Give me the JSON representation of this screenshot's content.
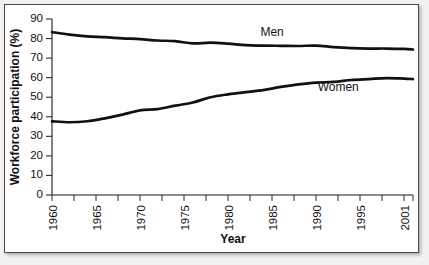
{
  "chart_data": {
    "type": "line",
    "title": "",
    "subtitle": "",
    "xlabel": "Year",
    "ylabel": "Workforce participation (%)",
    "xlim": [
      1960,
      2001
    ],
    "ylim": [
      0,
      90
    ],
    "yticks": [
      0,
      10,
      20,
      30,
      40,
      50,
      60,
      70,
      80,
      90
    ],
    "ytick_labels": [
      "0",
      "10",
      "20",
      "30",
      "40",
      "50",
      "60",
      "70",
      "80",
      "90"
    ],
    "xticks": [
      1960,
      1965,
      1970,
      1975,
      1980,
      1985,
      1990,
      1995,
      2001
    ],
    "xtick_labels": [
      "1960",
      "1965",
      "1970",
      "1975",
      "1980",
      "1985",
      "1990",
      "1995",
      "2001"
    ],
    "x_minor_tick_interval": 2.5,
    "grid": false,
    "legend_position": "inline-annotation",
    "line_color": "#111111",
    "frame_color": "#4b4b4b",
    "background_color": "#ffffff",
    "x": [
      1960,
      1962,
      1964,
      1966,
      1968,
      1970,
      1972,
      1974,
      1976,
      1978,
      1980,
      1982,
      1984,
      1986,
      1988,
      1990,
      1992,
      1994,
      1996,
      1998,
      2000,
      2001
    ],
    "series": [
      {
        "name": "Men",
        "label": "Men",
        "values": [
          83.3,
          82.0,
          81.1,
          80.7,
          80.1,
          79.7,
          79.0,
          78.7,
          77.5,
          77.9,
          77.4,
          76.6,
          76.4,
          76.3,
          76.2,
          76.4,
          75.6,
          75.1,
          74.9,
          74.9,
          74.7,
          74.4
        ]
      },
      {
        "name": "Women",
        "label": "Women",
        "values": [
          37.7,
          37.2,
          37.7,
          39.2,
          41.1,
          43.3,
          43.9,
          45.7,
          47.3,
          50.0,
          51.5,
          52.6,
          53.6,
          55.3,
          56.6,
          57.5,
          57.8,
          58.8,
          59.3,
          59.8,
          59.5,
          59.3
        ]
      }
    ],
    "annotations": [
      {
        "text": "Men",
        "x": 1985.0,
        "y": 81.5
      },
      {
        "text": "Women",
        "x": 1992.5,
        "y": 53.0
      }
    ]
  }
}
